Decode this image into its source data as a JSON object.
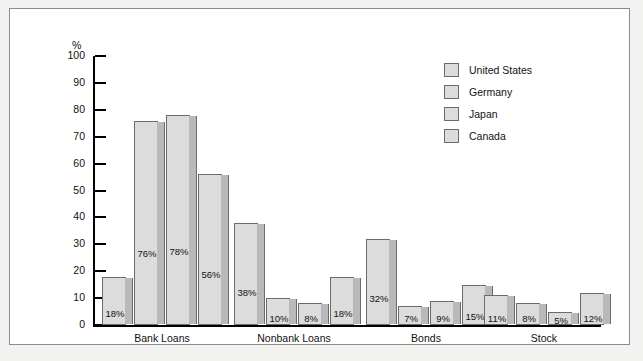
{
  "chart_data": {
    "type": "bar",
    "title": "",
    "xlabel": "",
    "ylabel": "%",
    "ylim": [
      0,
      100
    ],
    "ytick_labels": [
      "100",
      "90",
      "80",
      "70",
      "60",
      "50",
      "40",
      "30",
      "20",
      "10",
      "0"
    ],
    "ytick_values": [
      100,
      90,
      80,
      70,
      60,
      50,
      40,
      30,
      20,
      10,
      0
    ],
    "grid": false,
    "legend_position": "top-right",
    "categories": [
      "Bank Loans",
      "Nonbank Loans",
      "Bonds",
      "Stock"
    ],
    "series": [
      {
        "name": "United States",
        "values": [
          18,
          38,
          32,
          11
        ],
        "labels": [
          "18%",
          "38%",
          "32%",
          "11%"
        ]
      },
      {
        "name": "Germany",
        "values": [
          76,
          10,
          7,
          8
        ],
        "labels": [
          "76%",
          "10%",
          "7%",
          "8%"
        ]
      },
      {
        "name": "Japan",
        "values": [
          78,
          8,
          9,
          5
        ],
        "labels": [
          "78%",
          "8%",
          "9%",
          "5%"
        ]
      },
      {
        "name": "Canada",
        "values": [
          56,
          18,
          15,
          12
        ],
        "labels": [
          "56%",
          "18%",
          "15%",
          "12%"
        ]
      }
    ],
    "colors": {
      "bar_face": "#dcdcdc",
      "bar_side": "#b9b9b9",
      "bar_outline": "#6b6b6b",
      "axis": "#000000",
      "text": "#111111",
      "page_background": "#f2f2f0",
      "plot_background": "#ffffff"
    }
  },
  "legend": {
    "items": [
      {
        "label": "United States"
      },
      {
        "label": "Germany"
      },
      {
        "label": "Japan"
      },
      {
        "label": "Canada"
      }
    ]
  },
  "axis": {
    "unit_label": "%"
  }
}
